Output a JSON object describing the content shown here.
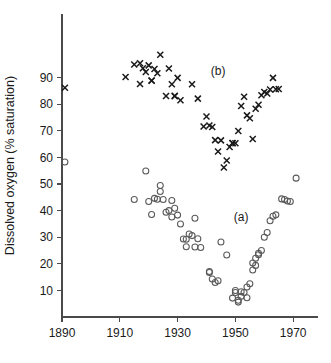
{
  "chart_data": {
    "type": "scatter",
    "title": "",
    "xlabel": "",
    "ylabel": "Dissolved oxygen (% saturation)",
    "xlim": [
      1886,
      1976
    ],
    "ylim": [
      0,
      100
    ],
    "xticks": [
      1890,
      1910,
      1930,
      1950,
      1970
    ],
    "xticklabels": [
      "1890",
      "1910",
      "1930",
      "1950",
      "1970"
    ],
    "yticks": [
      10,
      20,
      30,
      40,
      50,
      60,
      70,
      80,
      90
    ],
    "yticklabels": [
      "10",
      "20",
      "30",
      "40",
      "50",
      "60",
      "70",
      "80",
      "90"
    ],
    "grid": false,
    "legend": "inline-annotations",
    "annotations": [
      {
        "text": "(b)",
        "x": 1944,
        "y": 91
      },
      {
        "text": "(a)",
        "x": 1952,
        "y": 36
      }
    ],
    "series": [
      {
        "name": "(a)",
        "label": "(a)",
        "marker": "open-circle",
        "color": "#5a5a5a",
        "points": [
          [
            1891,
            58.3
          ],
          [
            1915,
            44.2
          ],
          [
            1919,
            54.9
          ],
          [
            1920,
            43.4
          ],
          [
            1921,
            38.5
          ],
          [
            1922,
            44.6
          ],
          [
            1923,
            44.3
          ],
          [
            1924,
            47.2
          ],
          [
            1924,
            49.4
          ],
          [
            1925,
            44.2
          ],
          [
            1926,
            39.4
          ],
          [
            1927,
            40.0
          ],
          [
            1928,
            43.8
          ],
          [
            1928,
            37.6
          ],
          [
            1929,
            40.9
          ],
          [
            1930,
            38.3
          ],
          [
            1931,
            35.0
          ],
          [
            1932,
            29.3
          ],
          [
            1933,
            29.2
          ],
          [
            1933,
            26.4
          ],
          [
            1934,
            31.2
          ],
          [
            1935,
            30.6
          ],
          [
            1936,
            26.3
          ],
          [
            1936,
            37.1
          ],
          [
            1937,
            29.4
          ],
          [
            1938,
            26.1
          ],
          [
            1941,
            17.1
          ],
          [
            1941,
            16.7
          ],
          [
            1942,
            14.3
          ],
          [
            1943,
            13.0
          ],
          [
            1944,
            13.6
          ],
          [
            1945,
            28.2
          ],
          [
            1947,
            23.3
          ],
          [
            1949,
            7.1
          ],
          [
            1950,
            9.2
          ],
          [
            1950,
            10.0
          ],
          [
            1951,
            6.3
          ],
          [
            1951,
            5.6
          ],
          [
            1952,
            7.8
          ],
          [
            1952,
            9.5
          ],
          [
            1953,
            9.2
          ],
          [
            1954,
            7.2
          ],
          [
            1954,
            11.3
          ],
          [
            1955,
            12.5
          ],
          [
            1956,
            20.3
          ],
          [
            1956,
            17.7
          ],
          [
            1957,
            22.1
          ],
          [
            1957,
            19.4
          ],
          [
            1958,
            24.0
          ],
          [
            1958,
            23.4
          ],
          [
            1959,
            25.0
          ],
          [
            1960,
            30.0
          ],
          [
            1961,
            31.8
          ],
          [
            1962,
            36.2
          ],
          [
            1963,
            37.9
          ],
          [
            1964,
            38.4
          ],
          [
            1966,
            44.4
          ],
          [
            1967,
            44.2
          ],
          [
            1968,
            43.6
          ],
          [
            1969,
            43.4
          ],
          [
            1971,
            52.2
          ]
        ]
      },
      {
        "name": "(b)",
        "label": "(b)",
        "marker": "cross",
        "color": "#1a1a1a",
        "points": [
          [
            1891,
            86.2
          ],
          [
            1912,
            90.2
          ],
          [
            1915,
            94.9
          ],
          [
            1917,
            95.4
          ],
          [
            1917,
            87.6
          ],
          [
            1918,
            93.5
          ],
          [
            1919,
            92.1
          ],
          [
            1920,
            94.6
          ],
          [
            1921,
            88.9
          ],
          [
            1921,
            88.8
          ],
          [
            1922,
            93.2
          ],
          [
            1923,
            91.6
          ],
          [
            1924,
            98.6
          ],
          [
            1926,
            83.1
          ],
          [
            1927,
            93.4
          ],
          [
            1928,
            87.5
          ],
          [
            1929,
            83.2
          ],
          [
            1929,
            83.0
          ],
          [
            1930,
            89.9
          ],
          [
            1931,
            81.5
          ],
          [
            1935,
            87.5
          ],
          [
            1937,
            82.1
          ],
          [
            1939,
            71.6
          ],
          [
            1940,
            75.4
          ],
          [
            1941,
            72.0
          ],
          [
            1942,
            71.4
          ],
          [
            1943,
            66.5
          ],
          [
            1944,
            62.2
          ],
          [
            1945,
            66.4
          ],
          [
            1946,
            56.2
          ],
          [
            1947,
            58.8
          ],
          [
            1948,
            63.9
          ],
          [
            1949,
            65.3
          ],
          [
            1949,
            65.4
          ],
          [
            1950,
            65.3
          ],
          [
            1951,
            69.9
          ],
          [
            1952,
            79.3
          ],
          [
            1953,
            82.8
          ],
          [
            1954,
            75.8
          ],
          [
            1955,
            74.7
          ],
          [
            1956,
            66.9
          ],
          [
            1957,
            78.3
          ],
          [
            1958,
            79.8
          ],
          [
            1959,
            83.4
          ],
          [
            1960,
            84.6
          ],
          [
            1961,
            84.0
          ],
          [
            1962,
            85.5
          ],
          [
            1963,
            89.9
          ],
          [
            1964,
            85.6
          ],
          [
            1965,
            85.7
          ]
        ]
      }
    ]
  }
}
